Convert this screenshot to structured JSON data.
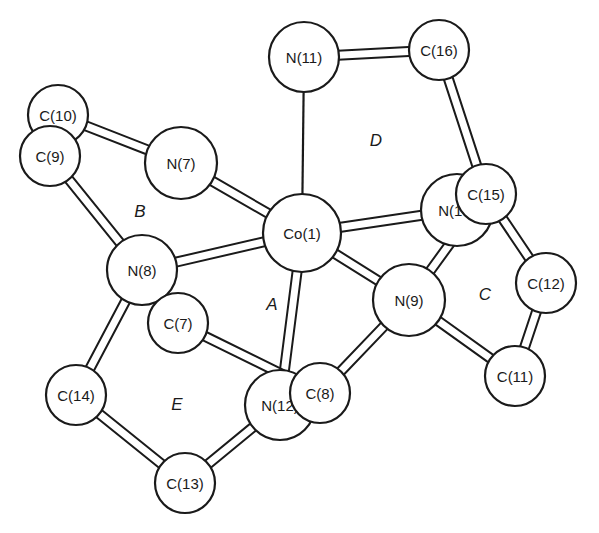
{
  "diagram": {
    "type": "molecular-structure",
    "title": "",
    "colors": {
      "stroke": "#1a1a1a",
      "fill": "#ffffff",
      "background": "#ffffff"
    },
    "atoms": [
      {
        "id": "C10",
        "label": "C(10)",
        "x": 58,
        "y": 115,
        "r": 30
      },
      {
        "id": "C9",
        "label": "C(9)",
        "x": 50,
        "y": 156,
        "r": 30
      },
      {
        "id": "N7",
        "label": "N(7)",
        "x": 181,
        "y": 163,
        "r": 36
      },
      {
        "id": "N11",
        "label": "N(11)",
        "x": 304,
        "y": 57,
        "r": 35
      },
      {
        "id": "C16",
        "label": "C(16)",
        "x": 439,
        "y": 50,
        "r": 30
      },
      {
        "id": "Co1",
        "label": "Co(1)",
        "x": 302,
        "y": 233,
        "r": 39
      },
      {
        "id": "N10",
        "label": "N(10)",
        "x": 457,
        "y": 210,
        "r": 36
      },
      {
        "id": "C15",
        "label": "C(15)",
        "x": 486,
        "y": 194,
        "r": 30
      },
      {
        "id": "N8",
        "label": "N(8)",
        "x": 142,
        "y": 270,
        "r": 35
      },
      {
        "id": "C7",
        "label": "C(7)",
        "x": 178,
        "y": 323,
        "r": 30
      },
      {
        "id": "N9",
        "label": "N(9)",
        "x": 409,
        "y": 300,
        "r": 36
      },
      {
        "id": "C12",
        "label": "C(12)",
        "x": 546,
        "y": 283,
        "r": 30
      },
      {
        "id": "C11",
        "label": "C(11)",
        "x": 515,
        "y": 376,
        "r": 30
      },
      {
        "id": "C14",
        "label": "C(14)",
        "x": 76,
        "y": 395,
        "r": 30
      },
      {
        "id": "N12",
        "label": "N(12)",
        "x": 280,
        "y": 405,
        "r": 35
      },
      {
        "id": "C8",
        "label": "C(8)",
        "x": 320,
        "y": 393,
        "r": 30
      },
      {
        "id": "C13",
        "label": "C(13)",
        "x": 185,
        "y": 483,
        "r": 30
      }
    ],
    "bonds": [
      {
        "from": "C10",
        "to": "N7",
        "style": "double-line"
      },
      {
        "from": "C9",
        "to": "N8",
        "style": "double-line"
      },
      {
        "from": "N7",
        "to": "Co1",
        "style": "double-line"
      },
      {
        "from": "N8",
        "to": "Co1",
        "style": "double-line"
      },
      {
        "from": "N11",
        "to": "Co1",
        "style": "thin"
      },
      {
        "from": "N11",
        "to": "C16",
        "style": "double-line"
      },
      {
        "from": "C16",
        "to": "C15",
        "style": "double-line"
      },
      {
        "from": "Co1",
        "to": "N10",
        "style": "double-line"
      },
      {
        "from": "Co1",
        "to": "N9",
        "style": "double-line"
      },
      {
        "from": "Co1",
        "to": "N12",
        "style": "double-line"
      },
      {
        "from": "C15",
        "to": "N9",
        "style": "double-line"
      },
      {
        "from": "C15",
        "to": "C12",
        "style": "double-line"
      },
      {
        "from": "C12",
        "to": "C11",
        "style": "double-line"
      },
      {
        "from": "N9",
        "to": "C11",
        "style": "double-line"
      },
      {
        "from": "N9",
        "to": "C8",
        "style": "double-line"
      },
      {
        "from": "N8",
        "to": "C7",
        "style": "double-line"
      },
      {
        "from": "C7",
        "to": "C8",
        "style": "double-line"
      },
      {
        "from": "N8",
        "to": "C14",
        "style": "double-line"
      },
      {
        "from": "C14",
        "to": "C13",
        "style": "double-line"
      },
      {
        "from": "C13",
        "to": "N12",
        "style": "double-line"
      }
    ],
    "draw_order": [
      "C10",
      "C9",
      "N7",
      "N11",
      "C16",
      "N10",
      "C15",
      "Co1",
      "N8",
      "C7",
      "N9",
      "C12",
      "C11",
      "C14",
      "N12",
      "C8",
      "C13"
    ],
    "ring_labels": [
      {
        "id": "A",
        "label": "A",
        "x": 272,
        "y": 304
      },
      {
        "id": "B",
        "label": "B",
        "x": 140,
        "y": 211
      },
      {
        "id": "C",
        "label": "C",
        "x": 485,
        "y": 294
      },
      {
        "id": "D",
        "label": "D",
        "x": 376,
        "y": 140
      },
      {
        "id": "E",
        "label": "E",
        "x": 177,
        "y": 404
      }
    ]
  }
}
